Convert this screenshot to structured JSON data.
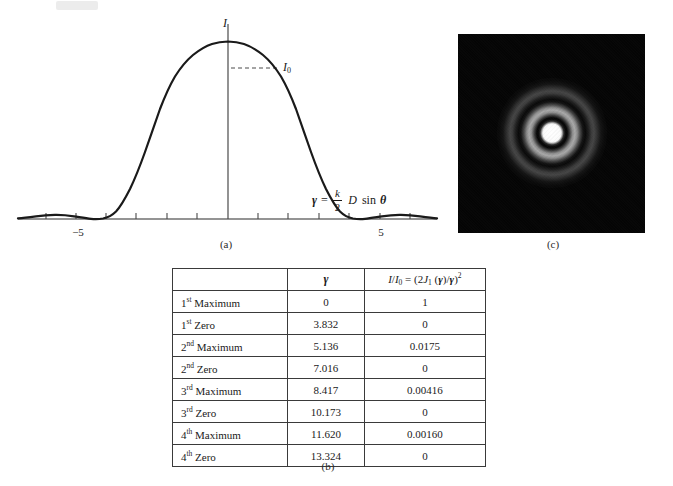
{
  "figure": {
    "panels": [
      {
        "id": "a",
        "caption": "(a)",
        "kind": "plot"
      },
      {
        "id": "b",
        "caption": "(b)",
        "kind": "table"
      },
      {
        "id": "c",
        "caption": "(c)",
        "kind": "photograph"
      }
    ]
  },
  "plot": {
    "y_axis_label": "I",
    "peak_label_base": "I",
    "peak_label_sub": "0",
    "x_axis_expression": {
      "symbol": "γ",
      "equals": "=",
      "fraction_numerator": "k",
      "fraction_denominator": "2",
      "factor": "D",
      "function": "sin",
      "angle": "θ",
      "plain": "γ = (k/2) D sin θ"
    },
    "x_tick_labels": [
      "−5",
      "5"
    ],
    "x_tick_values": [
      -5,
      5
    ]
  },
  "chart_data": {
    "type": "line",
    "title": "",
    "xlabel": "γ = (k/2) D sin θ",
    "ylabel": "I",
    "xlim": [
      -8.5,
      8.5
    ],
    "ylim": [
      0,
      1.08
    ],
    "grid": false,
    "legend": null,
    "annotations": [
      {
        "text": "I0",
        "x": 0,
        "y": 1,
        "note": "dashed leader from peak to label"
      }
    ],
    "xticks": [
      -7,
      -6,
      -5,
      -4,
      -3,
      -2,
      -1,
      0,
      1,
      2,
      3,
      4,
      5,
      6,
      7
    ],
    "xtick_labels": [
      "",
      "",
      "−5",
      "",
      "",
      "",
      "",
      "",
      "",
      "",
      "",
      "",
      "5",
      "",
      ""
    ],
    "series": [
      {
        "name": "I/I0 = (2J1(γ)/γ)^2",
        "x": [
          -8.5,
          -8.0,
          -7.5,
          -7.016,
          -6.5,
          -6.0,
          -5.5,
          -5.136,
          -4.7,
          -4.3,
          -3.832,
          -3.4,
          -3.0,
          -2.6,
          -2.2,
          -1.8,
          -1.4,
          -1.0,
          -0.6,
          -0.2,
          0,
          0.2,
          0.6,
          1.0,
          1.4,
          1.8,
          2.2,
          2.6,
          3.0,
          3.4,
          3.832,
          4.3,
          4.7,
          5.136,
          5.5,
          6.0,
          6.5,
          7.016,
          7.5,
          8.0,
          8.5
        ],
        "y": [
          0.0028,
          0.0038,
          0.002,
          0.0,
          0.0058,
          0.014,
          0.0172,
          0.0175,
          0.0132,
          0.0055,
          0.0,
          0.0138,
          0.0485,
          0.1085,
          0.197,
          0.3135,
          0.4545,
          0.6065,
          0.762,
          0.9755,
          1.0,
          0.9755,
          0.762,
          0.6065,
          0.4545,
          0.3135,
          0.197,
          0.1085,
          0.0485,
          0.0138,
          0.0,
          0.0055,
          0.0132,
          0.0175,
          0.0172,
          0.014,
          0.0058,
          0.0,
          0.002,
          0.0038,
          0.0028
        ]
      }
    ]
  },
  "table": {
    "headers": {
      "row_label": "",
      "gamma": "γ",
      "ratio_plain": "I/I0 = (2J1(γ)/γ)²",
      "ratio_parts": {
        "i1": "I",
        "slash": "/",
        "i2": "I",
        "i2_sub": "0",
        "equals": "=",
        "open": "(2",
        "j": "J",
        "j_sub": "1",
        "arg_open": "(",
        "gamma1": "γ",
        "arg_close": ")",
        "div": "/",
        "gamma2": "γ",
        "close": ")",
        "power": "2"
      }
    },
    "rows": [
      {
        "label_num": "1",
        "label_ord": "st",
        "label_kind": "Maximum",
        "gamma": "0",
        "ratio": "1"
      },
      {
        "label_num": "1",
        "label_ord": "st",
        "label_kind": "Zero",
        "gamma": "3.832",
        "ratio": "0"
      },
      {
        "label_num": "2",
        "label_ord": "nd",
        "label_kind": "Maximum",
        "gamma": "5.136",
        "ratio": "0.0175"
      },
      {
        "label_num": "2",
        "label_ord": "nd",
        "label_kind": "Zero",
        "gamma": "7.016",
        "ratio": "0"
      },
      {
        "label_num": "3",
        "label_ord": "rd",
        "label_kind": "Maximum",
        "gamma": "8.417",
        "ratio": "0.00416"
      },
      {
        "label_num": "3",
        "label_ord": "rd",
        "label_kind": "Zero",
        "gamma": "10.173",
        "ratio": "0"
      },
      {
        "label_num": "4",
        "label_ord": "th",
        "label_kind": "Maximum",
        "gamma": "11.620",
        "ratio": "0.00160"
      },
      {
        "label_num": "4",
        "label_ord": "th",
        "label_kind": "Zero",
        "gamma": "13.324",
        "ratio": "0"
      }
    ]
  },
  "photograph": {
    "description": "Airy diffraction pattern",
    "background_color": "#050505",
    "core_color": "#ffffff"
  },
  "captions": {
    "a": "(a)",
    "b": "(b)",
    "c": "(c)"
  }
}
